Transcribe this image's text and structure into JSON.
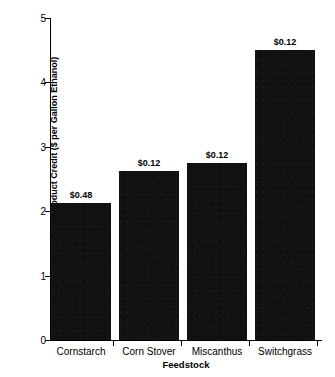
{
  "chart_data": {
    "type": "bar",
    "title": "",
    "subtitle": "",
    "xlabel": "Feedstock",
    "ylabel": "Total Cost with Coproduct Credit ($ per Gallon Ethanol)",
    "categories": [
      "Cornstarch",
      "Corn Stover",
      "Miscanthus",
      "Switchgrass"
    ],
    "values": [
      2.13,
      2.63,
      2.75,
      4.5
    ],
    "data_labels": [
      "$0.48",
      "$0.12",
      "$0.12",
      "$0.12"
    ],
    "ylim": [
      0,
      5
    ],
    "ytick_labels": [
      "0",
      "1",
      "2",
      "3",
      "4",
      "5"
    ],
    "ytick_values": [
      0,
      1,
      2,
      3,
      4,
      5
    ],
    "grid": false,
    "legend": null,
    "bar_color": "#111111",
    "axis_color": "#000000",
    "background_color": "#ffffff"
  }
}
